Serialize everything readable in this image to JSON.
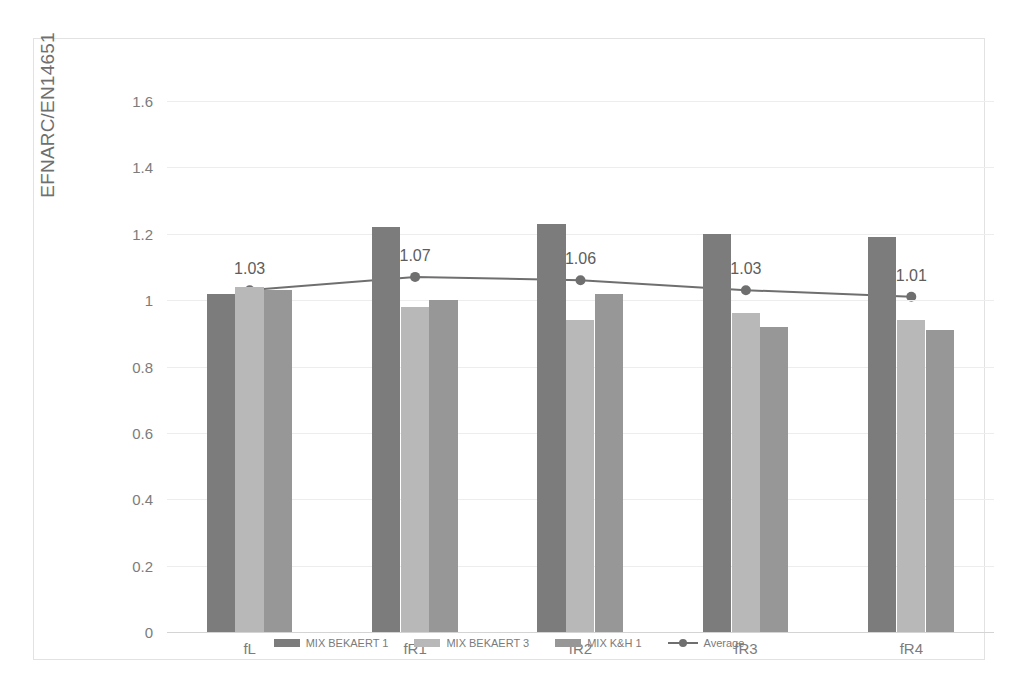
{
  "chart_data": {
    "type": "bar",
    "title": "",
    "subtitle": "",
    "xlabel": "",
    "ylabel": "EFNARC/EN14651",
    "categories": [
      "fL",
      "fR1",
      "fR2",
      "fR3",
      "fR4"
    ],
    "ylim": [
      0,
      1.6
    ],
    "ytick_labels": [
      "0",
      "0.2",
      "0.4",
      "0.6",
      "0.8",
      "1",
      "1.2",
      "1.4",
      "1.6"
    ],
    "ytick_values": [
      0,
      0.2,
      0.4,
      0.6,
      0.8,
      1.0,
      1.2,
      1.4,
      1.6
    ],
    "grid": true,
    "legend_position": "bottom",
    "series": [
      {
        "name": "MIX BEKAERT 1",
        "type": "bar",
        "color": "#7c7c7c",
        "values": [
          1.02,
          1.22,
          1.23,
          1.2,
          1.19
        ]
      },
      {
        "name": "MIX BEKAERT 3",
        "type": "bar",
        "color": "#b8b8b8",
        "values": [
          1.04,
          0.98,
          0.94,
          0.96,
          0.94
        ]
      },
      {
        "name": "MIX K&H 1",
        "type": "bar",
        "color": "#979797",
        "values": [
          1.03,
          1.0,
          1.02,
          0.92,
          0.91
        ]
      },
      {
        "name": "Average",
        "type": "line",
        "color": "#6f6f6f",
        "values": [
          1.03,
          1.07,
          1.06,
          1.03,
          1.01
        ],
        "data_labels": [
          "1.03",
          "1.07",
          "1.06",
          "1.03",
          "1.01"
        ]
      }
    ]
  },
  "legend": {
    "items": [
      {
        "label": "MIX BEKAERT 1",
        "marker": "bar-swatch"
      },
      {
        "label": "MIX BEKAERT 3",
        "marker": "bar-swatch"
      },
      {
        "label": "MIX K&H 1",
        "marker": "bar-swatch"
      },
      {
        "label": "Average",
        "marker": "line-marker"
      }
    ]
  },
  "colors": {
    "series1": "#7c7c7c",
    "series2": "#b8b8b8",
    "series3": "#979797",
    "line": "#6f6f6f",
    "gridline": "#ededed",
    "axis": "#d4d4d4",
    "text": "#7c7c7c",
    "frame": "#e2e2e2"
  }
}
